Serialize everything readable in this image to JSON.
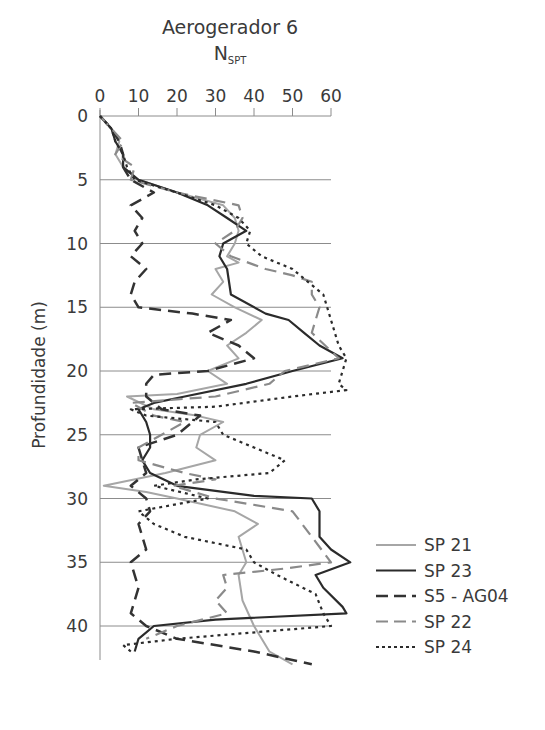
{
  "chart_data": {
    "type": "line",
    "title": "Aerogerador 6",
    "subtitle": "N",
    "subtitle_sub": "SPT",
    "xlabel": "NSPT",
    "ylabel": "Profundidade (m)",
    "x_axis_position": "top",
    "xlim": [
      0,
      60
    ],
    "ylim": [
      0,
      42
    ],
    "y_inverted": true,
    "x_ticks": [
      0,
      10,
      20,
      30,
      40,
      50,
      60
    ],
    "y_ticks": [
      0,
      5,
      10,
      15,
      20,
      25,
      30,
      35,
      40
    ],
    "grid": "horizontal at every 5 m",
    "legend_position": "right, lower",
    "series": [
      {
        "name": "SP 21",
        "style": "solid",
        "color": "#a6a6a6",
        "width": 2,
        "points": [
          [
            0,
            0
          ],
          [
            3,
            1
          ],
          [
            5,
            2
          ],
          [
            4,
            3
          ],
          [
            6,
            4
          ],
          [
            10,
            5
          ],
          [
            20,
            6
          ],
          [
            32,
            7
          ],
          [
            35,
            8
          ],
          [
            36,
            9
          ],
          [
            35,
            10
          ],
          [
            33,
            11
          ],
          [
            36,
            11.5
          ],
          [
            30,
            12
          ],
          [
            32,
            13
          ],
          [
            29,
            14
          ],
          [
            35,
            15
          ],
          [
            42,
            16
          ],
          [
            38,
            17
          ],
          [
            33,
            18
          ],
          [
            36,
            19
          ],
          [
            28,
            20
          ],
          [
            33,
            21
          ],
          [
            20,
            21.8
          ],
          [
            7,
            22
          ],
          [
            14,
            23
          ],
          [
            25,
            23.5
          ],
          [
            32,
            24
          ],
          [
            26,
            25
          ],
          [
            25,
            26
          ],
          [
            30,
            27
          ],
          [
            17,
            28
          ],
          [
            1,
            29
          ],
          [
            12,
            29.5
          ],
          [
            20,
            30
          ],
          [
            35,
            31
          ],
          [
            41,
            32
          ],
          [
            36,
            33
          ],
          [
            38,
            35
          ],
          [
            36,
            36
          ],
          [
            37,
            38
          ],
          [
            40,
            40
          ],
          [
            44,
            42
          ],
          [
            50,
            43
          ]
        ]
      },
      {
        "name": "SP 23",
        "style": "solid",
        "color": "#2b2b2b",
        "width": 2.2,
        "points": [
          [
            0,
            0
          ],
          [
            3,
            1
          ],
          [
            4,
            2
          ],
          [
            6,
            3
          ],
          [
            6,
            4
          ],
          [
            10,
            5
          ],
          [
            20,
            6
          ],
          [
            28,
            7
          ],
          [
            33,
            8
          ],
          [
            38,
            9
          ],
          [
            32,
            10
          ],
          [
            31,
            11
          ],
          [
            33,
            12
          ],
          [
            34,
            14
          ],
          [
            43,
            15.5
          ],
          [
            49,
            16
          ],
          [
            53,
            17
          ],
          [
            57,
            18
          ],
          [
            63,
            19
          ],
          [
            50,
            20
          ],
          [
            38,
            21
          ],
          [
            22,
            22
          ],
          [
            14,
            22.5
          ],
          [
            10,
            23
          ],
          [
            12,
            24
          ],
          [
            13,
            25
          ],
          [
            13,
            26
          ],
          [
            11,
            27
          ],
          [
            13,
            28
          ],
          [
            20,
            29
          ],
          [
            40,
            29.8
          ],
          [
            55,
            30
          ],
          [
            57,
            31
          ],
          [
            57,
            33
          ],
          [
            60,
            34
          ],
          [
            65,
            35
          ],
          [
            56,
            36
          ],
          [
            58,
            37
          ],
          [
            63,
            38.5
          ],
          [
            64,
            39
          ],
          [
            30,
            39.5
          ],
          [
            14,
            40
          ],
          [
            10,
            41
          ],
          [
            9,
            42
          ]
        ]
      },
      {
        "name": "S5 - AG04",
        "style": "dashed-long",
        "color": "#333333",
        "width": 2.5,
        "points": [
          [
            0,
            0
          ],
          [
            3,
            1
          ],
          [
            5,
            2
          ],
          [
            6,
            3
          ],
          [
            6,
            4
          ],
          [
            8,
            5
          ],
          [
            14,
            6
          ],
          [
            8,
            7
          ],
          [
            11,
            8
          ],
          [
            9,
            9
          ],
          [
            11,
            10
          ],
          [
            8,
            11
          ],
          [
            12,
            12
          ],
          [
            9,
            13
          ],
          [
            8,
            14
          ],
          [
            10,
            15
          ],
          [
            24,
            15.5
          ],
          [
            34,
            16
          ],
          [
            28,
            17
          ],
          [
            36,
            18
          ],
          [
            40,
            19
          ],
          [
            28,
            20
          ],
          [
            14,
            20.3
          ],
          [
            12,
            21
          ],
          [
            12,
            22
          ],
          [
            16,
            23
          ],
          [
            26,
            23.5
          ],
          [
            20,
            25
          ],
          [
            10,
            26
          ],
          [
            12,
            28
          ],
          [
            8,
            29
          ],
          [
            12,
            30
          ],
          [
            13,
            31
          ],
          [
            10,
            32
          ],
          [
            12,
            34
          ],
          [
            8,
            35
          ],
          [
            10,
            37
          ],
          [
            8,
            39
          ],
          [
            12,
            40
          ],
          [
            20,
            41
          ],
          [
            40,
            42
          ],
          [
            55,
            43
          ]
        ]
      },
      {
        "name": "SP 22",
        "style": "dashed-long",
        "color": "#8a8a8a",
        "width": 2.2,
        "points": [
          [
            0,
            0
          ],
          [
            3,
            1
          ],
          [
            6,
            2
          ],
          [
            4,
            3
          ],
          [
            9,
            4
          ],
          [
            8,
            5
          ],
          [
            20,
            6
          ],
          [
            36,
            7
          ],
          [
            37,
            8
          ],
          [
            35,
            9
          ],
          [
            30,
            10
          ],
          [
            34,
            11
          ],
          [
            43,
            12
          ],
          [
            50,
            12.5
          ],
          [
            55,
            13
          ],
          [
            55,
            14
          ],
          [
            57,
            15
          ],
          [
            56,
            16
          ],
          [
            55,
            17
          ],
          [
            62,
            19
          ],
          [
            48,
            20
          ],
          [
            44,
            21
          ],
          [
            30,
            22
          ],
          [
            8,
            22.5
          ],
          [
            14,
            23.5
          ],
          [
            22,
            24
          ],
          [
            16,
            25
          ],
          [
            10,
            26
          ],
          [
            10,
            27
          ],
          [
            22,
            28
          ],
          [
            30,
            28.5
          ],
          [
            19,
            29
          ],
          [
            30,
            30
          ],
          [
            50,
            31
          ],
          [
            55,
            33
          ],
          [
            60,
            35
          ],
          [
            48,
            35.5
          ],
          [
            32,
            36
          ],
          [
            33,
            37
          ],
          [
            30,
            38
          ],
          [
            33,
            39
          ],
          [
            20,
            40
          ],
          [
            12,
            41
          ]
        ]
      },
      {
        "name": "SP 24",
        "style": "dotted",
        "color": "#2b2b2b",
        "width": 2.2,
        "points": [
          [
            0,
            0
          ],
          [
            3,
            1
          ],
          [
            4,
            2
          ],
          [
            6,
            3
          ],
          [
            7,
            4
          ],
          [
            9,
            5
          ],
          [
            20,
            6
          ],
          [
            30,
            7
          ],
          [
            36,
            8
          ],
          [
            39,
            9
          ],
          [
            38,
            10
          ],
          [
            42,
            11
          ],
          [
            50,
            12
          ],
          [
            54,
            13
          ],
          [
            58,
            14
          ],
          [
            60,
            16
          ],
          [
            62,
            18
          ],
          [
            64,
            19
          ],
          [
            63,
            20
          ],
          [
            62,
            21
          ],
          [
            64,
            21.5
          ],
          [
            50,
            22
          ],
          [
            30,
            22.8
          ],
          [
            8,
            23
          ],
          [
            12,
            23.5
          ],
          [
            30,
            24
          ],
          [
            32,
            25
          ],
          [
            40,
            26
          ],
          [
            48,
            27
          ],
          [
            44,
            28
          ],
          [
            25,
            28.5
          ],
          [
            14,
            29
          ],
          [
            28,
            30
          ],
          [
            10,
            31
          ],
          [
            14,
            32
          ],
          [
            22,
            33
          ],
          [
            38,
            34
          ],
          [
            40,
            35
          ],
          [
            46,
            36
          ],
          [
            56,
            37.5
          ],
          [
            58,
            39
          ],
          [
            60,
            40
          ],
          [
            20,
            41
          ],
          [
            6,
            41.5
          ],
          [
            8,
            42
          ]
        ]
      }
    ]
  },
  "legend": [
    {
      "label": "SP 21"
    },
    {
      "label": "SP 23"
    },
    {
      "label": "S5 - AG04"
    },
    {
      "label": "SP 22"
    },
    {
      "label": "SP 24"
    }
  ]
}
